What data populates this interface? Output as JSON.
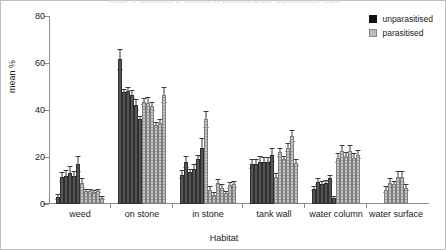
{
  "chart_data": {
    "type": "bar",
    "title": "mean % occupancy of habitats by parasitised and unparasitised hosts",
    "xlabel": "Habitat",
    "ylabel": "mean %",
    "ylim": [
      0,
      80
    ],
    "yticks": [
      0,
      20,
      40,
      60,
      80
    ],
    "grid": false,
    "legend_position": "top-right",
    "categories": [
      "weed",
      "on stone",
      "in stone",
      "tank wall",
      "water column",
      "water surface"
    ],
    "series": [
      {
        "name": "unparasitised",
        "color": "#555555",
        "groups": [
          {
            "category": "weed",
            "values": [
              3,
              11.5,
              12,
              13,
              12,
              17
            ],
            "errors": [
              1.2,
              2.0,
              2.5,
              3.0,
              2.0,
              3.5
            ]
          },
          {
            "category": "on stone",
            "values": [
              61.5,
              47.5,
              48,
              46.5,
              42,
              36
            ],
            "errors": [
              4.5,
              1.5,
              2.0,
              2.0,
              2.5,
              1.5
            ]
          },
          {
            "category": "in stone",
            "values": [
              12.5,
              18,
              13.5,
              15,
              19,
              24
            ],
            "errors": [
              2.0,
              2.5,
              1.5,
              2.0,
              2.0,
              4.0
            ]
          },
          {
            "category": "tank wall",
            "values": [
              17,
              17,
              18,
              18,
              18,
              21
            ],
            "errors": [
              2.0,
              2.0,
              2.5,
              2.0,
              2.0,
              3.0
            ]
          },
          {
            "category": "water column",
            "values": [
              6.5,
              9.5,
              8.5,
              9,
              11,
              2.5
            ],
            "errors": [
              1.0,
              1.5,
              1.2,
              1.2,
              1.5,
              0.8
            ]
          },
          {
            "category": "water surface",
            "values": [],
            "errors": []
          }
        ]
      },
      {
        "name": "parasitised",
        "color": "#c6c6c6",
        "groups": [
          {
            "category": "weed",
            "values": [
              9,
              5.5,
              5.5,
              5,
              5.5,
              2.5
            ],
            "errors": [
              2.0,
              1.0,
              1.0,
              1.0,
              1.0,
              0.8
            ]
          },
          {
            "category": "on stone",
            "values": [
              43.5,
              43,
              41.5,
              33.5,
              34.5,
              46.5
            ],
            "errors": [
              1.5,
              2.5,
              2.0,
              1.5,
              1.5,
              3.5
            ]
          },
          {
            "category": "in stone",
            "values": [
              36,
              6,
              4,
              9,
              7,
              4.5
            ],
            "errors": [
              3.5,
              1.5,
              1.0,
              1.5,
              1.5,
              1.0
            ]
          },
          {
            "category": "tank wall",
            "values": [
              11.5,
              22,
              19,
              24,
              29,
              17.5
            ],
            "errors": [
              1.5,
              2.0,
              1.5,
              2.0,
              2.5,
              1.5
            ]
          },
          {
            "category": "water column",
            "values": [
              19.5,
              22.5,
              20,
              22.5,
              19.5,
              21
            ],
            "errors": [
              2.0,
              2.5,
              2.0,
              2.5,
              2.0,
              2.0
            ]
          },
          {
            "category": "water surface",
            "values": [
              6,
              9,
              8.5,
              11.5,
              11.5,
              7
            ],
            "errors": [
              1.5,
              2.0,
              1.5,
              2.5,
              2.5,
              1.5
            ]
          }
        ]
      }
    ],
    "in_stone_extra": {
      "values": [
        8,
        8.5
      ],
      "errors": [
        1.5,
        1.5
      ]
    }
  },
  "legend": {
    "entries": [
      {
        "label": "unparasitised",
        "swatch": "dark-swatch-icon"
      },
      {
        "label": "parasitised",
        "swatch": "light-swatch-icon"
      }
    ]
  },
  "axes": {
    "y_title": "mean %",
    "x_title": "Habitat",
    "y_tick_labels": [
      "80",
      "60",
      "40",
      "20",
      "0"
    ]
  }
}
